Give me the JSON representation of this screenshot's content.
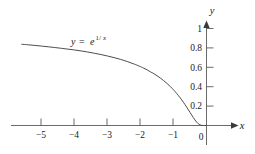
{
  "chart_data": {
    "type": "line",
    "title": "",
    "subtitle": "",
    "xlabel": "x",
    "ylabel": "y",
    "xlim": [
      -5.7,
      0.55
    ],
    "ylim": [
      -0.08,
      1.18
    ],
    "grid": false,
    "legend": null,
    "annotations": [
      {
        "name": "curve-equation",
        "text": "y = e^(1/x)",
        "parts": {
          "lhs": "y",
          "equals": "=",
          "base": "e",
          "exponent_numerator": "1",
          "exponent_slash": "/",
          "exponent_denominator": "x"
        },
        "x": -3.55,
        "y": 0.86
      }
    ],
    "xticks": [
      -5,
      -4,
      -3,
      -2,
      -1,
      0
    ],
    "xtick_labels": [
      "−5",
      "−4",
      "−3",
      "−2",
      "−1",
      "0"
    ],
    "yticks": [
      0.2,
      0.4,
      0.6,
      0.8,
      1
    ],
    "ytick_labels": [
      "0.2",
      "0.4",
      "0.6",
      "0.8",
      "1"
    ],
    "origin_label": "0",
    "series": [
      {
        "name": "y = e^(1/x)",
        "color": "#4d4d4d",
        "linewidth": 1,
        "x": [
          -5.6,
          -5.4,
          -5.2,
          -5.0,
          -4.8,
          -4.6,
          -4.4,
          -4.2,
          -4.0,
          -3.8,
          -3.6,
          -3.4,
          -3.2,
          -3.0,
          -2.8,
          -2.6,
          -2.4,
          -2.2,
          -2.0,
          -1.9,
          -1.8,
          -1.7,
          -1.6,
          -1.5,
          -1.4,
          -1.3,
          -1.2,
          -1.1,
          -1.0,
          -0.95,
          -0.9,
          -0.85,
          -0.8,
          -0.75,
          -0.7,
          -0.65,
          -0.6,
          -0.55,
          -0.5,
          -0.45,
          -0.4,
          -0.35,
          -0.3,
          -0.25,
          -0.2,
          -0.15,
          -0.1,
          -0.05,
          -0.02
        ],
        "y": [
          0.8375,
          0.8318,
          0.8257,
          0.8187,
          0.8116,
          0.804,
          0.7958,
          0.7872,
          0.7788,
          0.7691,
          0.7575,
          0.7452,
          0.7316,
          0.7165,
          0.6996,
          0.6812,
          0.6592,
          0.6345,
          0.6065,
          0.5905,
          0.5738,
          0.5537,
          0.5353,
          0.5134,
          0.4895,
          0.4634,
          0.4346,
          0.4029,
          0.3679,
          0.349,
          0.3292,
          0.3077,
          0.2865,
          0.2636,
          0.2397,
          0.2147,
          0.1889,
          0.162,
          0.1353,
          0.1084,
          0.0821,
          0.0574,
          0.0357,
          0.0183,
          0.0067,
          0.0013,
          5e-05,
          0.0,
          0.0
        ]
      }
    ]
  }
}
